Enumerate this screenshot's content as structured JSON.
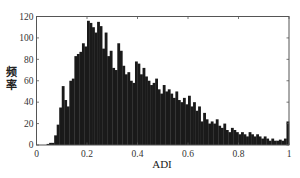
{
  "chart_data": {
    "type": "bar",
    "subtype": "histogram",
    "title": "",
    "xlabel": "ADI",
    "ylabel": "频率",
    "xlim": [
      0,
      1
    ],
    "ylim": [
      0,
      120
    ],
    "xticks": [
      "0",
      "0.2",
      "0.4",
      "0.6",
      "0.8",
      "1"
    ],
    "yticks": [
      "0",
      "20",
      "40",
      "60",
      "80",
      "100",
      "120"
    ],
    "grid": false,
    "legend": null,
    "bin_width": 0.01,
    "bin_start": 0.0,
    "bar_color": "#1a1a1a",
    "values": [
      0,
      0,
      0,
      0,
      1,
      2,
      2,
      9,
      19,
      35,
      55,
      42,
      36,
      60,
      62,
      83,
      85,
      87,
      95,
      92,
      116,
      114,
      110,
      105,
      115,
      111,
      90,
      105,
      83,
      88,
      72,
      70,
      95,
      88,
      74,
      66,
      68,
      60,
      58,
      78,
      76,
      66,
      72,
      64,
      60,
      56,
      58,
      62,
      52,
      48,
      56,
      50,
      52,
      48,
      44,
      50,
      42,
      40,
      44,
      38,
      46,
      36,
      40,
      32,
      36,
      22,
      30,
      24,
      20,
      22,
      20,
      24,
      18,
      16,
      20,
      14,
      12,
      16,
      14,
      12,
      10,
      12,
      10,
      8,
      12,
      10,
      8,
      10,
      8,
      6,
      8,
      6,
      4,
      6,
      4,
      4,
      5,
      4,
      6,
      22
    ]
  }
}
